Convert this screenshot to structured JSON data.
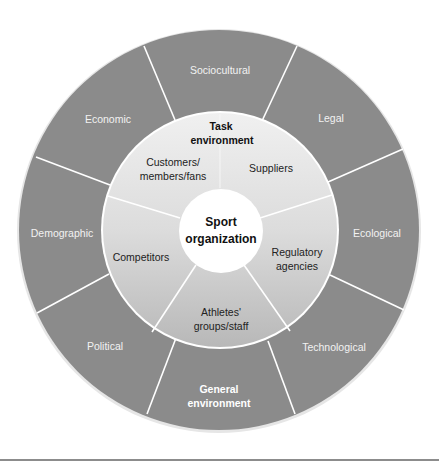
{
  "diagram": {
    "center": {
      "line1": "Sport",
      "line2": "organization"
    },
    "task_environment": {
      "title_line1": "Task",
      "title_line2": "environment",
      "segments": [
        {
          "line1": "Customers/",
          "line2": "members/fans"
        },
        {
          "line1": "Suppliers",
          "line2": ""
        },
        {
          "line1": "Regulatory",
          "line2": "agencies"
        },
        {
          "line1": "Athletes'",
          "line2": "groups/staff"
        },
        {
          "line1": "Competitors",
          "line2": ""
        }
      ]
    },
    "general_environment": {
      "title_line1": "General",
      "title_line2": "environment",
      "segments": [
        {
          "label": "Sociocultural"
        },
        {
          "label": "Legal"
        },
        {
          "label": "Ecological"
        },
        {
          "label": "Technological"
        },
        {
          "label": "Political"
        },
        {
          "label": "Demographic"
        },
        {
          "label": "Economic"
        }
      ]
    },
    "colors": {
      "outer_ring": "#8a8a8a",
      "middle_ring_light": "#ececec",
      "middle_ring_dark": "#bdbdbd",
      "center": "#ffffff",
      "divider": "#ffffff"
    }
  }
}
